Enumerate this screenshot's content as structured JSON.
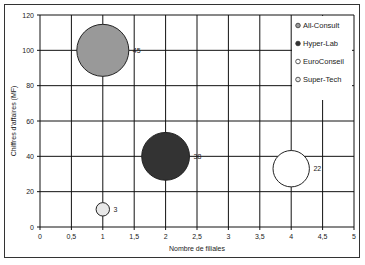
{
  "chart_data": {
    "type": "bubble",
    "title": "",
    "xlabel": "Nombre de filiales",
    "ylabel": "Chiffres d'affaires (MF)",
    "xlim": [
      0,
      5
    ],
    "ylim": [
      0,
      120
    ],
    "x_ticks": [
      "0",
      "0,5",
      "1",
      "1,5",
      "2",
      "2,5",
      "3",
      "3,5",
      "4",
      "4,5",
      "5"
    ],
    "y_ticks": [
      "0",
      "20",
      "40",
      "60",
      "80",
      "100",
      "120"
    ],
    "grid": true,
    "legend_position": "right-inside",
    "series": [
      {
        "name": "All-Consult",
        "x": 1,
        "y": 100,
        "size": 45,
        "label": "45",
        "color": "#999999"
      },
      {
        "name": "Hyper-Lab",
        "x": 2,
        "y": 40,
        "size": 38,
        "label": "38",
        "color": "#333333"
      },
      {
        "name": "EuroConseil",
        "x": 4,
        "y": 33,
        "size": 22,
        "label": "22",
        "color": "#ffffff"
      },
      {
        "name": "Super-Tech",
        "x": 1,
        "y": 10,
        "size": 3,
        "label": "3",
        "color": "#e8e8e8"
      }
    ]
  }
}
